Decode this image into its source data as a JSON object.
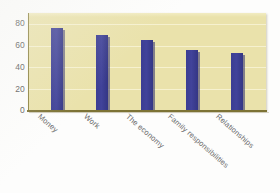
{
  "chart_data": {
    "type": "bar",
    "title": "",
    "subtitle": "",
    "xlabel": "",
    "ylabel": "",
    "categories": [
      "Money",
      "Work",
      "The economy",
      "Family responsibilities",
      "Relationships"
    ],
    "values": [
      76,
      70,
      65,
      56,
      53
    ],
    "series": [
      {
        "name": "",
        "values": [
          76,
          70,
          65,
          56,
          53
        ]
      }
    ],
    "ylim": [
      0,
      90
    ],
    "yticks": [
      "0",
      "20",
      "40",
      "60",
      "80"
    ],
    "ytick_values": [
      0,
      20,
      40,
      60,
      80
    ],
    "grid": true,
    "grid_axis": "y",
    "legend": false,
    "legend_position": "none",
    "annotations": []
  },
  "style": {
    "bar_color": "#3b3d93",
    "plot_background": "#eae2ab",
    "gridline_color": "#f6f1cf",
    "axis_color": "#7d7335",
    "tick_label_color": "#5d5d5d",
    "page_background": "#fdfdfc"
  }
}
